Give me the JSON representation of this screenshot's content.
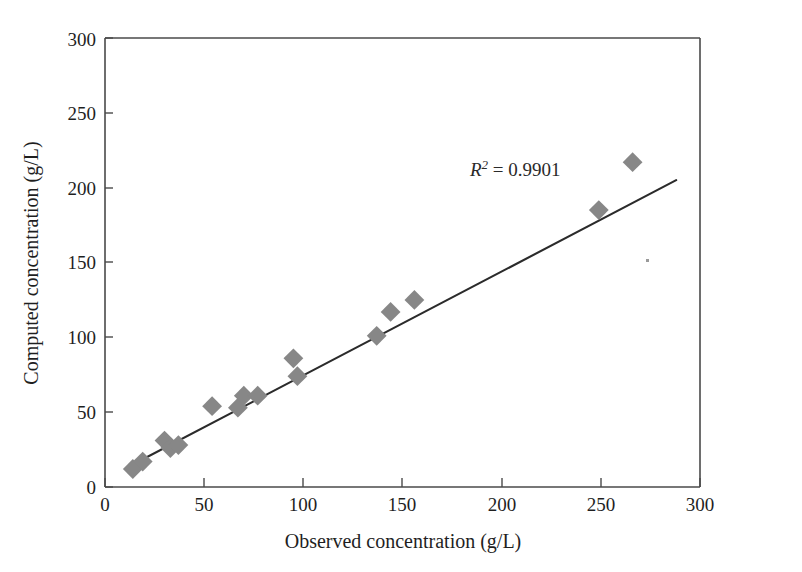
{
  "figure": {
    "background_color": "#ffffff",
    "marker_color": "#878787",
    "line_color": "#2b2b2b",
    "axis_color": "#4a4a4a"
  },
  "annotation": {
    "r_symbol": "R",
    "r_exponent": "2",
    "r_equals": " = 0.9901",
    "full_text": "R2 = 0.9901",
    "x_value": 185,
    "y_value": 215
  },
  "chart_data": {
    "type": "scatter",
    "title": "",
    "xlabel": "Observed concentration (g/L)",
    "ylabel": "Computed concentration (g/L)",
    "xlim": [
      0,
      300
    ],
    "ylim": [
      0,
      300
    ],
    "xticks": [
      0,
      50,
      100,
      150,
      200,
      250,
      300
    ],
    "yticks": [
      0,
      50,
      100,
      150,
      200,
      250,
      300
    ],
    "xtick_labels": [
      "0",
      "50",
      "100",
      "150",
      "200",
      "250",
      "300"
    ],
    "ytick_labels": [
      "0",
      "50",
      "100",
      "150",
      "200",
      "250",
      "300"
    ],
    "grid": false,
    "legend": null,
    "marker": "diamond",
    "series": [
      {
        "name": "Observed vs computed",
        "points": [
          [
            14,
            12
          ],
          [
            19,
            17
          ],
          [
            30,
            31
          ],
          [
            33,
            26
          ],
          [
            37,
            28
          ],
          [
            54,
            54
          ],
          [
            67,
            53
          ],
          [
            70,
            61
          ],
          [
            77,
            61
          ],
          [
            95,
            86
          ],
          [
            97,
            74
          ],
          [
            137,
            101
          ],
          [
            144,
            117
          ],
          [
            156,
            125
          ],
          [
            249,
            185
          ],
          [
            266,
            217
          ]
        ]
      }
    ],
    "trendline": {
      "type": "linear",
      "x_start": 14,
      "y_start": 15,
      "x_end": 288,
      "y_end": 205,
      "r_squared": 0.9901,
      "r_squared_text": "R2 = 0.9901"
    },
    "annotations": [
      {
        "text": "R2 = 0.9901",
        "x": 185,
        "y": 215
      }
    ]
  }
}
